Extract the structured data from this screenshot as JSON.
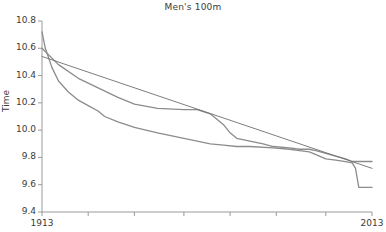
{
  "chart_data": {
    "type": "line",
    "title": "Men's 100m",
    "xlabel": "",
    "ylabel": "Time",
    "xlim": [
      1913,
      2013
    ],
    "ylim": [
      9.4,
      10.8
    ],
    "grid": false,
    "legend": null,
    "xticks": [
      1913,
      1927,
      1941,
      1956,
      1970,
      1984,
      1999,
      2013
    ],
    "xtick_labels": [
      "1913",
      "",
      "",
      "",
      "",
      "",
      "",
      "2013"
    ],
    "yticks": [
      9.4,
      9.6,
      9.8,
      10.0,
      10.2,
      10.4,
      10.6,
      10.8
    ],
    "ytick_labels": [
      "9.4",
      "9.6",
      "9.8",
      "10.0",
      "10.2",
      "10.4",
      "10.6",
      "10.8"
    ],
    "line_color": "#8c8c8c",
    "fit_color": "#6e6e6e",
    "axis_color": "#9a9a9a",
    "series": [
      {
        "name": "world record",
        "x": [
          1913,
          1914,
          1916,
          1918,
          1921,
          1924,
          1927,
          1930,
          1932,
          1936,
          1941,
          1948,
          1956,
          1960,
          1964,
          1968,
          1972,
          1976,
          1983,
          1988,
          1991,
          1994,
          1996,
          1999,
          2002,
          2005,
          2007,
          2008,
          2009,
          2013
        ],
        "y": [
          10.72,
          10.6,
          10.46,
          10.36,
          10.28,
          10.22,
          10.18,
          10.14,
          10.1,
          10.06,
          10.02,
          9.98,
          9.94,
          9.92,
          9.9,
          9.89,
          9.88,
          9.88,
          9.87,
          9.86,
          9.85,
          9.84,
          9.82,
          9.79,
          9.78,
          9.77,
          9.76,
          9.72,
          9.58,
          9.58
        ]
      },
      {
        "name": "stepped record trace",
        "x": [
          1913,
          1918,
          1924,
          1930,
          1936,
          1941,
          1948,
          1956,
          1960,
          1964,
          1968,
          1970,
          1972,
          1976,
          1980,
          1983,
          1988,
          1991,
          1994,
          1996,
          1999,
          2002,
          2005,
          2007,
          2009,
          2013
        ],
        "y": [
          10.6,
          10.48,
          10.38,
          10.31,
          10.24,
          10.19,
          10.16,
          10.15,
          10.15,
          10.12,
          10.04,
          9.98,
          9.94,
          9.92,
          9.9,
          9.88,
          9.87,
          9.86,
          9.86,
          9.85,
          9.83,
          9.81,
          9.79,
          9.77,
          9.77,
          9.77
        ]
      },
      {
        "name": "linear fit",
        "x": [
          1913,
          2013
        ],
        "y": [
          10.54,
          9.72
        ]
      }
    ]
  }
}
